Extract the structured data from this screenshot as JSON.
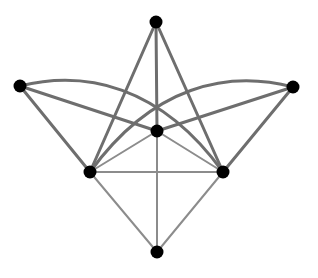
{
  "diagram": {
    "type": "graph",
    "background": "#ffffff",
    "node_radius": 6.5,
    "node_color": "#000000",
    "edge_styles": {
      "thick": {
        "color": "#6e6e6e",
        "width": 3
      },
      "thin": {
        "color": "#8c8c8c",
        "width": 2
      }
    },
    "nodes": [
      {
        "id": "top",
        "x": 156,
        "y": 22
      },
      {
        "id": "left",
        "x": 20,
        "y": 86
      },
      {
        "id": "right",
        "x": 293,
        "y": 87
      },
      {
        "id": "center",
        "x": 157,
        "y": 131
      },
      {
        "id": "lower-left",
        "x": 90,
        "y": 172
      },
      {
        "id": "lower-right",
        "x": 223,
        "y": 172
      },
      {
        "id": "bottom",
        "x": 157,
        "y": 252
      }
    ],
    "edges": [
      {
        "from": "top",
        "to": "lower-left",
        "style": "thick",
        "shape": "line"
      },
      {
        "from": "top",
        "to": "lower-right",
        "style": "thick",
        "shape": "line"
      },
      {
        "from": "top",
        "to": "center",
        "style": "thick",
        "shape": "line"
      },
      {
        "from": "left",
        "to": "lower-left",
        "style": "thick",
        "shape": "line"
      },
      {
        "from": "left",
        "to": "center",
        "style": "thick",
        "shape": "line"
      },
      {
        "from": "left",
        "to": "lower-right",
        "style": "thick",
        "shape": "curve",
        "cx1": 85,
        "cy1": 70,
        "cx2": 160,
        "cy2": 85
      },
      {
        "from": "right",
        "to": "lower-right",
        "style": "thick",
        "shape": "line"
      },
      {
        "from": "right",
        "to": "center",
        "style": "thick",
        "shape": "line"
      },
      {
        "from": "right",
        "to": "lower-left",
        "style": "thick",
        "shape": "curve",
        "cx1": 228,
        "cy1": 70,
        "cx2": 153,
        "cy2": 85
      },
      {
        "from": "lower-left",
        "to": "lower-right",
        "style": "thin",
        "shape": "line"
      },
      {
        "from": "center",
        "to": "lower-left",
        "style": "thin",
        "shape": "line"
      },
      {
        "from": "center",
        "to": "lower-right",
        "style": "thin",
        "shape": "line"
      },
      {
        "from": "center",
        "to": "bottom",
        "style": "thin",
        "shape": "line"
      },
      {
        "from": "bottom",
        "to": "lower-left",
        "style": "thin",
        "shape": "line"
      },
      {
        "from": "bottom",
        "to": "lower-right",
        "style": "thin",
        "shape": "line"
      }
    ]
  }
}
